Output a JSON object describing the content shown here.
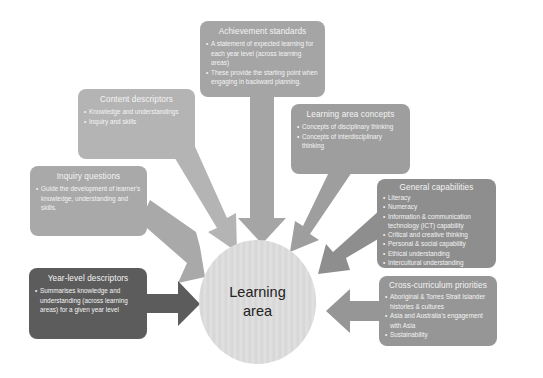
{
  "center": {
    "line1": "Learning",
    "line2": "area"
  },
  "boxes": {
    "achievement": {
      "title": "Achievement standards",
      "items": [
        "A statement of expected learning for each year level (across learning areas)",
        "These provide the starting point when engaging in backward planning."
      ]
    },
    "content": {
      "title": "Content descriptors",
      "items": [
        "Knowledge and understandings",
        "Inquiry and skills"
      ]
    },
    "concepts": {
      "title": "Learning area concepts",
      "items": [
        "Concepts of disciplinary thinking",
        "Concepts of interdisciplinary thinking"
      ]
    },
    "inquiry": {
      "title": "Inquiry questions",
      "items": [
        "Guide the development of learner's knowledge, understanding and skills."
      ]
    },
    "general": {
      "title": "General capabilities",
      "items": [
        "Literacy",
        "Numeracy",
        "Information & communication technology (ICT) capability",
        "Critical and creative thinking",
        "Personal & social capability",
        "Ethical understanding",
        "Intercultural understanding"
      ]
    },
    "yearlevel": {
      "title": "Year-level descriptors",
      "items": [
        "Summarises knowledge and understanding (across learning areas) for a given year level"
      ]
    },
    "crosscurric": {
      "title": "Cross-curriculum priorities",
      "items": [
        "Aboriginal & Torres Strait Islander histories & cultures",
        "Asia and Australia's engagement with Asia",
        "Sustainability"
      ]
    }
  },
  "colors": {
    "achievement": "#a5a5a5",
    "content": "#b4b4b4",
    "concepts": "#9e9e9e",
    "inquiry": "#a9a9a9",
    "general": "#8e8e8e",
    "yearlevel": "#5c5c5c",
    "crosscurric": "#969696",
    "center": "#dcdcdc"
  }
}
